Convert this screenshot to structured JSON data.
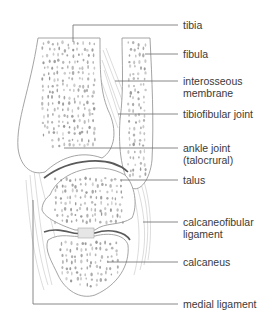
{
  "diagram": {
    "labels": [
      {
        "id": "tibia",
        "text": "tibia"
      },
      {
        "id": "fibula",
        "text": "fibula"
      },
      {
        "id": "interosseous-membrane",
        "text": "interosseous\nmembrane",
        "lines": [
          "interosseous",
          "membrane"
        ]
      },
      {
        "id": "tibiofibular-joint",
        "text": "tibiofibular joint"
      },
      {
        "id": "ankle-joint",
        "text": "ankle joint (talocrural)",
        "lines": [
          "ankle joint",
          "(talocrural)"
        ]
      },
      {
        "id": "talus",
        "text": "talus"
      },
      {
        "id": "calcaneofibular-ligament",
        "text": "calcaneofibular ligament",
        "lines": [
          "calcaneofibular",
          "ligament"
        ]
      },
      {
        "id": "calcaneus",
        "text": "calcaneus"
      },
      {
        "id": "medial-ligament",
        "text": "medial ligament"
      }
    ]
  }
}
